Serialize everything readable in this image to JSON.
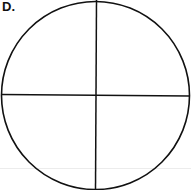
{
  "panel": {
    "label": "D."
  },
  "diagram": {
    "type": "circle-divided-into-quarters",
    "parts": 4,
    "stroke_color": "#111111",
    "background_color": "#ffffff"
  }
}
